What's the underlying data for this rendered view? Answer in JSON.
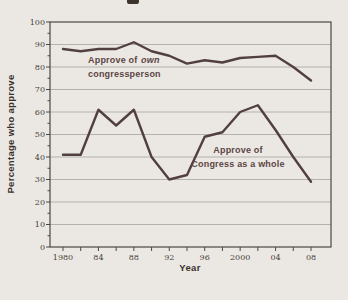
{
  "page": {
    "background": "#ebe8e3",
    "cropped_title_visible": true
  },
  "chart": {
    "annotations": {
      "own_part1": "Approve of",
      "own_emphasis": "own",
      "own_line2": "congressperson",
      "whole_line1": "Approve of",
      "whole_line2": "Congress as a whole"
    },
    "colors": {
      "background": "#ebe8e3",
      "grid": "#b5b2ad",
      "axis": "#4c4845",
      "line": "#524040",
      "annotation": "#5c4545",
      "tick_text": "#4a4139",
      "axis_text": "#3a322a"
    }
  },
  "chart_data": {
    "type": "line",
    "x": [
      1980,
      1982,
      1984,
      1986,
      1988,
      1990,
      1992,
      1994,
      1996,
      1998,
      2000,
      2002,
      2004,
      2006,
      2008
    ],
    "series": [
      {
        "name": "Approve of own congressperson",
        "values": [
          88,
          87,
          88,
          88,
          91,
          87,
          85,
          81.5,
          83,
          82,
          84,
          84.5,
          85,
          80,
          74
        ]
      },
      {
        "name": "Approve of Congress as a whole",
        "values": [
          41,
          41,
          61,
          54,
          61,
          40,
          30,
          32,
          49,
          51,
          60,
          63,
          52,
          40,
          29
        ]
      }
    ],
    "title": "",
    "xlabel": "Year",
    "ylabel": "Percentage who approve",
    "ylim": [
      0,
      100
    ],
    "xlim_years": [
      1980,
      2008
    ],
    "y_ticks": [
      0,
      10,
      20,
      30,
      40,
      50,
      60,
      70,
      80,
      90,
      100
    ],
    "y_minor_tick_step": 5,
    "x_minor_tick_step_years": 2,
    "x_labeled_years": [
      1980,
      1984,
      1988,
      1992,
      1996,
      2000,
      2004,
      2008
    ],
    "x_tick_labels": [
      "1980",
      "84",
      "88",
      "92",
      "96",
      "2000",
      "04",
      "08"
    ],
    "grid": true,
    "legend": "inline-annotations"
  }
}
